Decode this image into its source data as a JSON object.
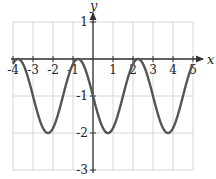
{
  "chart_data": {
    "type": "line",
    "title": "",
    "xlabel": "x",
    "ylabel": "y",
    "xlim": [
      -4,
      5
    ],
    "ylim": [
      -3,
      1
    ],
    "grid": true,
    "x_ticks": [
      "-4",
      "-3",
      "-2",
      "-1",
      "1",
      "2",
      "3",
      "4",
      "5"
    ],
    "y_ticks": [
      "1",
      "-1",
      "-2",
      "-3"
    ],
    "function": "y = cos((2π/3)(x + 0.75)) - 1",
    "series": [
      {
        "name": "curve",
        "color": "#555555",
        "maxima": [
          [
            -3.75,
            0
          ],
          [
            -0.75,
            0
          ],
          [
            2.25,
            0
          ]
        ],
        "minima": [
          [
            -2.25,
            -2
          ],
          [
            0.75,
            -2
          ],
          [
            3.75,
            -2
          ]
        ],
        "x": [
          -4,
          -3.75,
          -3,
          -2.25,
          -1.5,
          -0.75,
          0,
          0.75,
          1.5,
          2.25,
          3,
          3.75,
          4.5,
          5
        ],
        "y": [
          -0.13,
          0,
          -0.5,
          -2,
          -0.5,
          0,
          -1,
          -2,
          -1,
          0,
          -1,
          -2,
          -1,
          -0.13
        ]
      }
    ]
  }
}
